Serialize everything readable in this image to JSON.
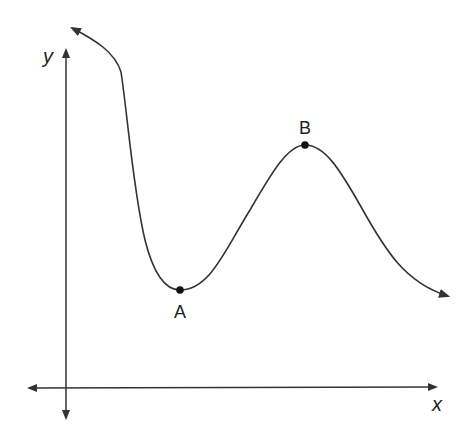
{
  "diagram": {
    "type": "function-graph",
    "axes": {
      "x_label": "x",
      "y_label": "y"
    },
    "points": [
      {
        "label": "A",
        "kind": "local minimum"
      },
      {
        "label": "B",
        "kind": "local maximum"
      }
    ],
    "colors": {
      "stroke": "#333333",
      "background": "#ffffff"
    }
  }
}
